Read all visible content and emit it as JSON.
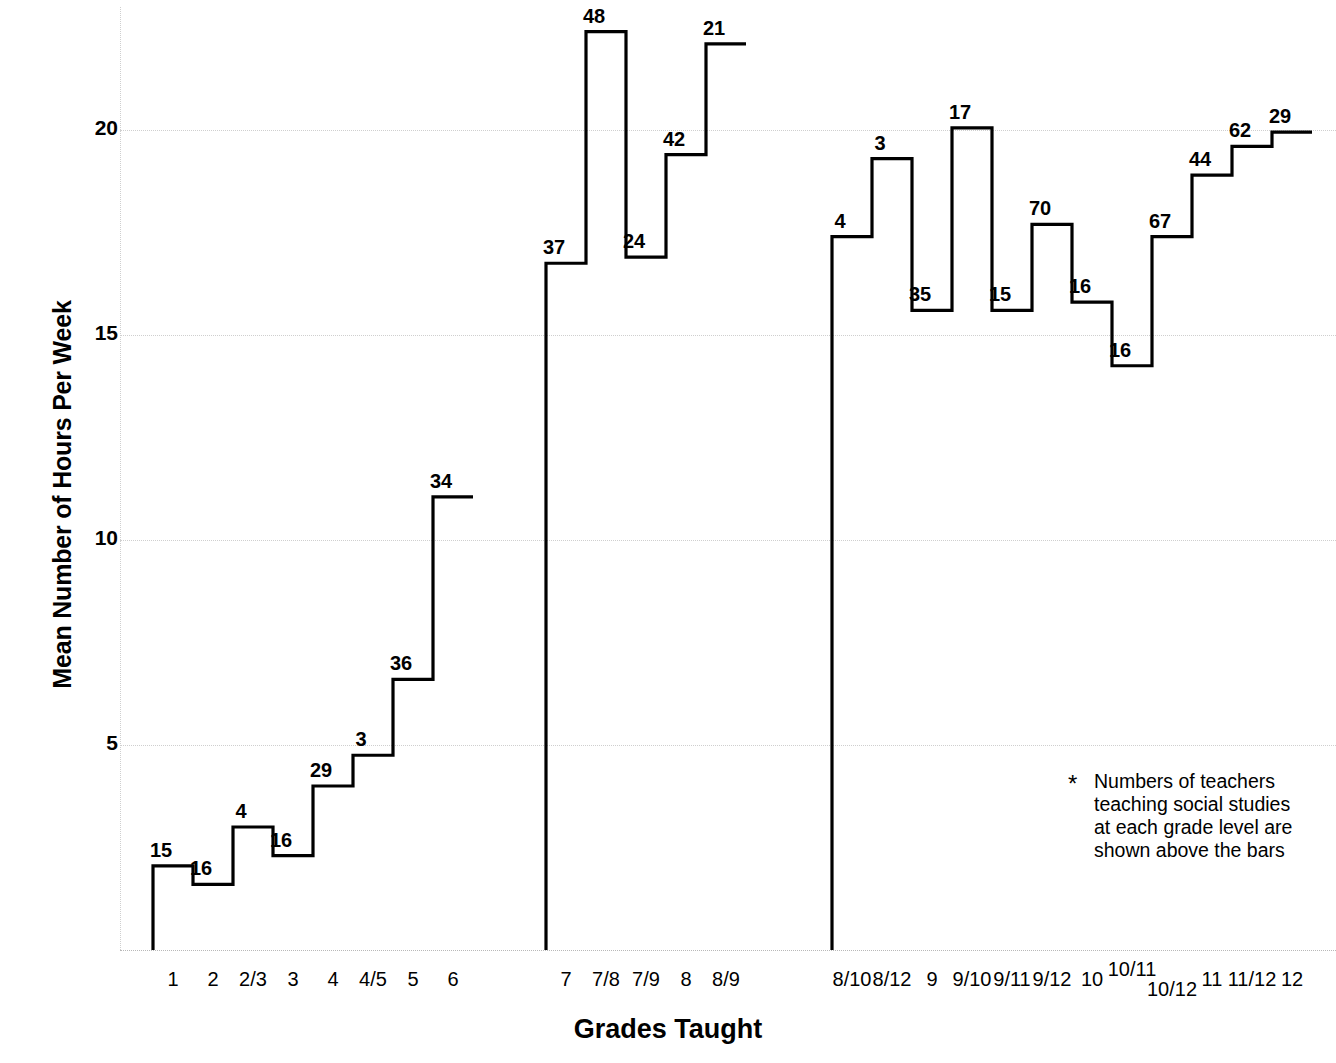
{
  "chart_data": {
    "type": "bar",
    "title": "",
    "xlabel": "Grades Taught",
    "ylabel": "Mean Number of Hours Per Week",
    "ylim": [
      0,
      23
    ],
    "yticks": [
      5,
      10,
      15,
      20
    ],
    "grid": true,
    "legend": null,
    "annotation": {
      "marker": "*",
      "lines": [
        "Numbers  of  teachers",
        "teaching social studies",
        "at each grade level are",
        "shown above the bars"
      ]
    },
    "note": "Bar-top labels are the number of teachers (n) at each grade level; bar heights are mean hours per week.",
    "groups": [
      {
        "name": "elementary",
        "categories": [
          "1",
          "2",
          "2/3",
          "3",
          "4",
          "4/5",
          "5",
          "6"
        ],
        "values": [
          2.05,
          1.6,
          3.0,
          2.3,
          4.0,
          4.75,
          6.6,
          11.05
        ],
        "labels": [
          "15",
          "16",
          "4",
          "16",
          "29",
          "3",
          "36",
          "34"
        ]
      },
      {
        "name": "middle",
        "categories": [
          "7",
          "7/8",
          "7/9",
          "8",
          "8/9"
        ],
        "values": [
          16.75,
          22.4,
          16.9,
          19.4,
          22.1
        ],
        "labels": [
          "37",
          "48",
          "24",
          "42",
          "21"
        ]
      },
      {
        "name": "secondary",
        "categories": [
          "8/10",
          "8/12",
          "9",
          "9/10",
          "9/11",
          "9/12",
          "10",
          "10/11",
          "10/12",
          "11",
          "11/12",
          "12"
        ],
        "values": [
          17.4,
          19.3,
          15.6,
          20.05,
          15.6,
          17.7,
          15.8,
          14.25,
          17.4,
          18.9,
          19.6,
          19.95
        ],
        "labels": [
          "4",
          "3",
          "35",
          "17",
          "15",
          "70",
          "16",
          "16",
          "67",
          "44",
          "62",
          "29"
        ]
      }
    ]
  },
  "axis": {
    "y_title": "Mean Number of Hours Per Week",
    "x_title": "Grades Taught",
    "y_tick_labels": [
      "20",
      "15",
      "10",
      "5"
    ]
  }
}
